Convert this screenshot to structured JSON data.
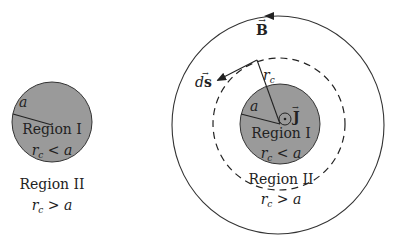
{
  "colors": {
    "conductor_fill": "#9a9a9a",
    "stroke": "#222222",
    "background": "#ffffff"
  },
  "left_figure": {
    "radius_label": "a",
    "region1_label": "Region I",
    "region1_condition": "rᴄ < a",
    "region2_label": "Region II",
    "region2_condition": "rᴄ > a"
  },
  "right_figure": {
    "field_label": "B",
    "field_vector_mark": "⃗",
    "path_element_label": "ds",
    "amperian_radius_label": "r",
    "amperian_radius_sub": "c",
    "radius_label": "a",
    "current_density_label": "J",
    "current_direction_icon": "out-of-page",
    "region1_label": "Region I",
    "region1_condition_lhs": "r",
    "region1_condition_sub": "c",
    "region1_condition_rhs": " < a",
    "region2_label": "Region II",
    "region2_condition_lhs": "r",
    "region2_condition_sub": "c",
    "region2_condition_rhs": " > a"
  }
}
